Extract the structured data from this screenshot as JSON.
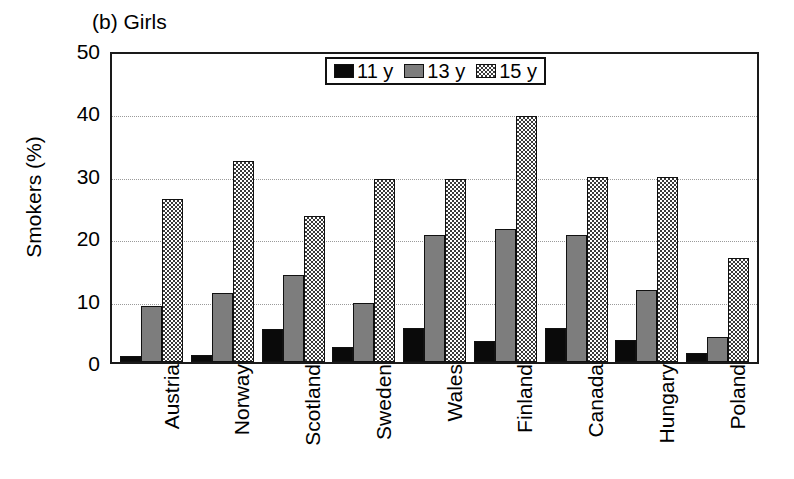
{
  "chart_data": {
    "type": "bar",
    "title": "(b) Girls",
    "xlabel": "",
    "ylabel": "Smokers (%)",
    "ylim": [
      0,
      50
    ],
    "yticks": [
      50,
      40,
      30,
      20,
      10,
      0
    ],
    "grid": true,
    "legend_position": "top-center",
    "categories": [
      "Austria",
      "Norway",
      "Scotland",
      "Sweden",
      "Wales",
      "Finland",
      "Canada",
      "Hungary",
      "Poland"
    ],
    "series": [
      {
        "name": "11 y",
        "color": "#0a0a0a",
        "pattern": "solid-black",
        "values": [
          1.0,
          1.1,
          5.3,
          2.4,
          5.4,
          3.4,
          5.4,
          3.6,
          1.4
        ]
      },
      {
        "name": "13 y",
        "color": "#7d7d7d",
        "pattern": "solid-gray",
        "values": [
          9.0,
          11.1,
          14.0,
          9.4,
          20.3,
          21.3,
          20.4,
          11.6,
          4.0
        ]
      },
      {
        "name": "15 y",
        "color": "#b0b0b0",
        "pattern": "checkerboard",
        "values": [
          26.1,
          32.2,
          23.4,
          29.4,
          29.4,
          39.4,
          29.6,
          29.7,
          16.6
        ]
      }
    ]
  },
  "legend": {
    "entries": [
      {
        "label": "11 y"
      },
      {
        "label": "13 y"
      },
      {
        "label": "15 y"
      }
    ]
  },
  "colors": {
    "axis": "#1a1a1a",
    "gridline": "#9a9a9a",
    "background": "#ffffff"
  }
}
